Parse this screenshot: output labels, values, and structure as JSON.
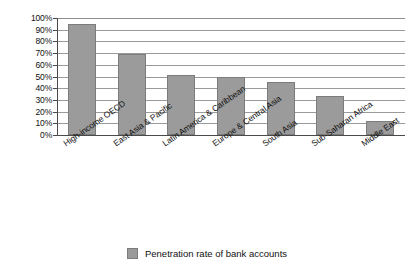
{
  "chart_data": {
    "type": "bar",
    "title": "",
    "subtitle": "",
    "xlabel": "",
    "ylabel": "",
    "ylim": [
      0,
      100
    ],
    "y_unit": "%",
    "grid": true,
    "legend_position": "bottom-center",
    "categories": [
      "High-income OECD",
      "East Asia & Pacific",
      "Latin America & Caribbean",
      "Europe & Central Asia",
      "South Asia",
      "Sub-Saharan Africa",
      "Middle East"
    ],
    "series": [
      {
        "name": "Penetration rate of bank accounts",
        "color": "#9b9b9b",
        "values": [
          95,
          69,
          51,
          50,
          45,
          33,
          12
        ]
      }
    ],
    "y_ticks": [
      "0%",
      "10%",
      "20%",
      "30%",
      "40%",
      "50%",
      "60%",
      "70%",
      "80%",
      "90%",
      "100%"
    ],
    "y_tick_values": [
      0,
      10,
      20,
      30,
      40,
      50,
      60,
      70,
      80,
      90,
      100
    ]
  },
  "legend": {
    "items": [
      {
        "label": "Penetration rate of bank accounts",
        "color": "#9b9b9b"
      }
    ]
  },
  "colors": {
    "bar_fill": "#9b9b9b",
    "bar_stroke": "#7c7c7c",
    "gridline": "#9a9a9a",
    "axis": "#4a4a4a",
    "background": "#ffffff",
    "text": "#111111"
  }
}
